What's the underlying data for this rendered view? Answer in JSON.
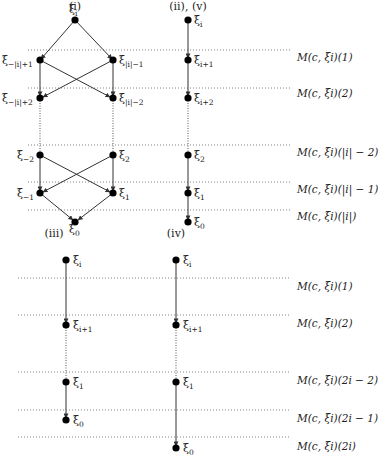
{
  "panels": {
    "i": {
      "title": "(i)",
      "nodes": [
        {
          "id": "top",
          "base": "ξ",
          "sub": "i"
        },
        {
          "id": "l1",
          "base": "ξ",
          "sub": "−|i|+1"
        },
        {
          "id": "r1",
          "base": "ξ",
          "sub": "|i|−1"
        },
        {
          "id": "l2",
          "base": "ξ",
          "sub": "−|i|+2"
        },
        {
          "id": "r2",
          "base": "ξ",
          "sub": "|i|−2"
        },
        {
          "id": "l3",
          "base": "ξ",
          "sub": "−2"
        },
        {
          "id": "r3",
          "base": "ξ",
          "sub": "2"
        },
        {
          "id": "l4",
          "base": "ξ",
          "sub": "−1"
        },
        {
          "id": "r4",
          "base": "ξ",
          "sub": "1"
        },
        {
          "id": "bot",
          "base": "ξ",
          "sub": "0"
        }
      ]
    },
    "ii_v": {
      "title": "(ii), (v)",
      "nodes": [
        {
          "base": "ξ",
          "sub": "i"
        },
        {
          "base": "ξ",
          "sub": "i+1"
        },
        {
          "base": "ξ",
          "sub": "i+2"
        },
        {
          "base": "ξ",
          "sub": "2"
        },
        {
          "base": "ξ",
          "sub": "1"
        },
        {
          "base": "ξ",
          "sub": "0"
        }
      ],
      "levels": [
        "M(c, ξi)(1)",
        "M(c, ξi)(2)",
        "M(c, ξi)(|i| − 2)",
        "M(c, ξi)(|i| − 1)",
        "M(c, ξi)(|i|)"
      ]
    },
    "iii": {
      "title": "(iii)",
      "nodes": [
        {
          "base": "ξ",
          "sub": "i"
        },
        {
          "base": "ξ",
          "sub": "i+1"
        },
        {
          "base": "ξ",
          "sub": "1"
        },
        {
          "base": "ξ",
          "sub": "0"
        }
      ]
    },
    "iv": {
      "title": "(iv)",
      "nodes": [
        {
          "base": "ξ",
          "sub": "i"
        },
        {
          "base": "ξ",
          "sub": "i+1"
        },
        {
          "base": "ξ",
          "sub": "1"
        },
        {
          "base": "ξ",
          "sub": "0"
        }
      ],
      "levels": [
        "M(c, ξi)(1)",
        "M(c, ξi)(2)",
        "M(c, ξi)(2i − 2)",
        "M(c, ξi)(2i − 1)",
        "M(c, ξi)(2i)"
      ]
    }
  }
}
